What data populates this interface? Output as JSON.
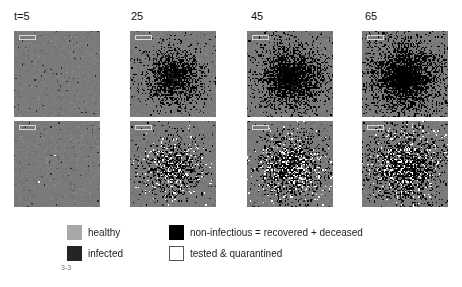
{
  "columns": [
    {
      "label": "t=5",
      "time": 5
    },
    {
      "label": "25",
      "time": 25
    },
    {
      "label": "45",
      "time": 45
    },
    {
      "label": "65",
      "time": 65
    }
  ],
  "rows": [
    {
      "name": "without-testing",
      "panels": [
        {
          "infected_density": 0.03,
          "noninfectious_density": 0.0,
          "quarantined_density": 0.0,
          "spread": 0.25
        },
        {
          "infected_density": 0.15,
          "noninfectious_density": 0.75,
          "quarantined_density": 0.0,
          "spread": 0.55
        },
        {
          "infected_density": 0.1,
          "noninfectious_density": 0.85,
          "quarantined_density": 0.0,
          "spread": 0.65
        },
        {
          "infected_density": 0.08,
          "noninfectious_density": 0.88,
          "quarantined_density": 0.0,
          "spread": 0.72
        }
      ]
    },
    {
      "name": "with-testing",
      "panels": [
        {
          "infected_density": 0.03,
          "noninfectious_density": 0.0,
          "quarantined_density": 0.005,
          "spread": 0.25
        },
        {
          "infected_density": 0.12,
          "noninfectious_density": 0.4,
          "quarantined_density": 0.18,
          "spread": 0.55
        },
        {
          "infected_density": 0.1,
          "noninfectious_density": 0.45,
          "quarantined_density": 0.2,
          "spread": 0.65
        },
        {
          "infected_density": 0.08,
          "noninfectious_density": 0.5,
          "quarantined_density": 0.15,
          "spread": 0.72
        }
      ]
    }
  ],
  "colors": {
    "healthy": "#7a7a7a",
    "infected": "#2a2a2a",
    "noninfectious": "#000000",
    "quarantined": "#ffffff",
    "legend_healthy": "#a8a8a8",
    "legend_infected": "#252525"
  },
  "legend": {
    "items": [
      {
        "label": "healthy",
        "color": "#a8a8a8"
      },
      {
        "label": "infected",
        "color": "#252525"
      },
      {
        "label": "non-infectious = recovered + deceased",
        "color": "#000000"
      },
      {
        "label": "tested & quarantined",
        "color": "#ffffff"
      }
    ]
  },
  "figure_number": "3-3"
}
